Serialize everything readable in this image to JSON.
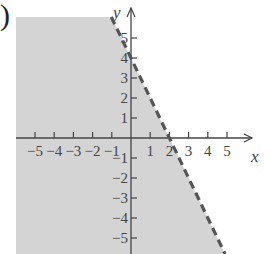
{
  "label": {
    "paren": ")"
  },
  "chart_data": {
    "type": "inequality-graph",
    "title": "",
    "xlabel": "x",
    "ylabel": "y",
    "xlim": [
      -6,
      6
    ],
    "ylim": [
      -6,
      6
    ],
    "grid": false,
    "x_ticks": [
      -5,
      -4,
      -3,
      -2,
      -1,
      1,
      2,
      3,
      4,
      5
    ],
    "y_ticks": [
      5,
      4,
      3,
      2,
      1,
      -1,
      -2,
      -3,
      -4,
      -5
    ],
    "x_tick_labels": [
      "−5",
      "−4",
      "−3",
      "−2",
      "−1",
      "1",
      "2",
      "3",
      "4",
      "5"
    ],
    "y_tick_labels": [
      "5",
      "4",
      "3",
      "2",
      "1",
      "−1",
      "−2",
      "−3",
      "−4",
      "−5"
    ],
    "boundary": {
      "equation": "y = -2x + 4",
      "slope": -2,
      "intercept": 4,
      "style": "dashed",
      "points": [
        [
          0,
          4
        ],
        [
          2,
          0
        ]
      ]
    },
    "shaded_region": "below boundary line",
    "inequality": "y < -2x + 4",
    "colors": {
      "shade": "#d4d4d4",
      "boundary": "#555555",
      "axes": "#444444"
    }
  }
}
